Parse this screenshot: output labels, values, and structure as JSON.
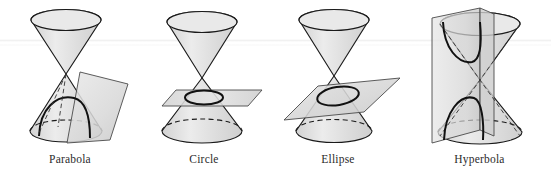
{
  "figure": {
    "background_color": "#ffffff",
    "width": 551,
    "height": 177,
    "stroke_color": "#1a1a1a",
    "cone_fill": "#e6e6e6",
    "plane_fill": "#dcdcdc",
    "caption_color": "#2b2b2b"
  },
  "panels": [
    {
      "id": "parabola",
      "label": "Parabola",
      "description": "A double cone cut by a plane parallel to one generating line, producing a parabola.",
      "cut_curve": "parabola",
      "plane_orientation": "slanted, parallel to a side of the cone",
      "cone_count": 2,
      "intersects_nappes": 1
    },
    {
      "id": "circle",
      "label": "Circle",
      "description": "A double cone cut by a plane perpendicular to the axis, producing a circle.",
      "cut_curve": "circle",
      "plane_orientation": "horizontal, perpendicular to the cone axis",
      "cone_count": 2,
      "intersects_nappes": 1
    },
    {
      "id": "ellipse",
      "label": "Ellipse",
      "description": "A double cone cut by an oblique plane meeting one nappe, producing an ellipse.",
      "cut_curve": "ellipse",
      "plane_orientation": "tilted, oblique to the cone axis",
      "cone_count": 2,
      "intersects_nappes": 1
    },
    {
      "id": "hyperbola",
      "label": "Hyperbola",
      "description": "A double cone cut by a vertical plane meeting both nappes, producing a hyperbola with two branches.",
      "cut_curve": "hyperbola",
      "plane_orientation": "vertical, parallel to the cone axis",
      "cone_count": 2,
      "intersects_nappes": 2
    }
  ]
}
